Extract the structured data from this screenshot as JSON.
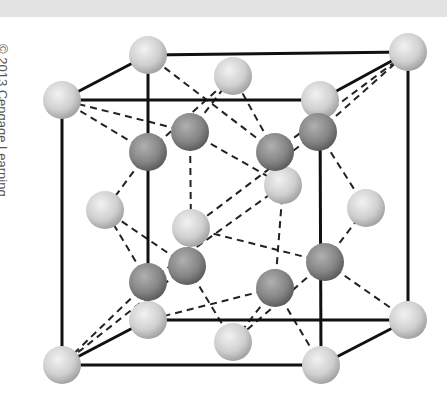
{
  "credit": {
    "text": "© 2013 Cengage Learning"
  },
  "diagram": {
    "colors": {
      "edge": "#111111",
      "bond": "#222222",
      "light_atom": "#d9d9d9",
      "light_atom_shadow": "#9a9a9a",
      "dark_atom": "#8e8e8e",
      "dark_atom_shadow": "#555555",
      "background": "#ffffff",
      "strip": "#e3e3e3"
    },
    "atom_radius": 19,
    "atoms": [
      {
        "id": "c-back-top-left",
        "type": "light",
        "x": 148,
        "y": 55
      },
      {
        "id": "c-back-top-right",
        "type": "light",
        "x": 408,
        "y": 52
      },
      {
        "id": "c-front-top-left",
        "type": "light",
        "x": 62,
        "y": 100
      },
      {
        "id": "c-front-top-right",
        "type": "light",
        "x": 320,
        "y": 100
      },
      {
        "id": "c-back-bottom-left",
        "type": "light",
        "x": 148,
        "y": 320
      },
      {
        "id": "c-back-bottom-right",
        "type": "light",
        "x": 408,
        "y": 320
      },
      {
        "id": "c-front-bottom-left",
        "type": "light",
        "x": 62,
        "y": 365
      },
      {
        "id": "c-front-bottom-right",
        "type": "light",
        "x": 321,
        "y": 365
      },
      {
        "id": "f-top",
        "type": "light",
        "x": 233,
        "y": 76
      },
      {
        "id": "f-back",
        "type": "light",
        "x": 283,
        "y": 185
      },
      {
        "id": "f-front",
        "type": "light",
        "x": 191,
        "y": 228
      },
      {
        "id": "f-left",
        "type": "light",
        "x": 105,
        "y": 210
      },
      {
        "id": "f-right",
        "type": "light",
        "x": 366,
        "y": 208
      },
      {
        "id": "f-bottom",
        "type": "light",
        "x": 233,
        "y": 342
      },
      {
        "id": "t1",
        "type": "dark",
        "x": 148,
        "y": 152
      },
      {
        "id": "t2",
        "type": "dark",
        "x": 190,
        "y": 132
      },
      {
        "id": "t3",
        "type": "dark",
        "x": 275,
        "y": 152
      },
      {
        "id": "t4",
        "type": "dark",
        "x": 318,
        "y": 132
      },
      {
        "id": "t5",
        "type": "dark",
        "x": 187,
        "y": 266
      },
      {
        "id": "t6",
        "type": "dark",
        "x": 148,
        "y": 282
      },
      {
        "id": "t7",
        "type": "dark",
        "x": 275,
        "y": 288
      },
      {
        "id": "t8",
        "type": "dark",
        "x": 325,
        "y": 262
      }
    ],
    "edges": [
      [
        148,
        55,
        408,
        52
      ],
      [
        62,
        100,
        320,
        100
      ],
      [
        62,
        100,
        148,
        55
      ],
      [
        320,
        100,
        408,
        52
      ],
      [
        62,
        100,
        62,
        365
      ],
      [
        320,
        100,
        321,
        365
      ],
      [
        408,
        52,
        408,
        320
      ],
      [
        148,
        55,
        148,
        320
      ],
      [
        62,
        365,
        321,
        365
      ],
      [
        148,
        320,
        408,
        320
      ],
      [
        62,
        365,
        148,
        320
      ],
      [
        321,
        365,
        408,
        320
      ]
    ],
    "bonds": [
      [
        148,
        152,
        148,
        55
      ],
      [
        148,
        152,
        62,
        100
      ],
      [
        148,
        152,
        233,
        76
      ],
      [
        148,
        152,
        105,
        210
      ],
      [
        190,
        132,
        233,
        76
      ],
      [
        190,
        132,
        62,
        100
      ],
      [
        190,
        132,
        191,
        228
      ],
      [
        190,
        132,
        283,
        185
      ],
      [
        275,
        152,
        233,
        76
      ],
      [
        275,
        152,
        408,
        52
      ],
      [
        275,
        152,
        283,
        185
      ],
      [
        275,
        152,
        148,
        55
      ],
      [
        318,
        132,
        320,
        100
      ],
      [
        318,
        132,
        408,
        52
      ],
      [
        318,
        132,
        366,
        208
      ],
      [
        318,
        132,
        191,
        228
      ],
      [
        187,
        266,
        191,
        228
      ],
      [
        187,
        266,
        105,
        210
      ],
      [
        187,
        266,
        233,
        342
      ],
      [
        187,
        266,
        62,
        365
      ],
      [
        148,
        282,
        148,
        320
      ],
      [
        148,
        282,
        105,
        210
      ],
      [
        148,
        282,
        283,
        185
      ],
      [
        148,
        282,
        62,
        365
      ],
      [
        275,
        288,
        283,
        185
      ],
      [
        275,
        288,
        233,
        342
      ],
      [
        275,
        288,
        321,
        365
      ],
      [
        275,
        288,
        148,
        320
      ],
      [
        325,
        262,
        366,
        208
      ],
      [
        325,
        262,
        408,
        320
      ],
      [
        325,
        262,
        233,
        342
      ],
      [
        325,
        262,
        191,
        228
      ]
    ]
  }
}
